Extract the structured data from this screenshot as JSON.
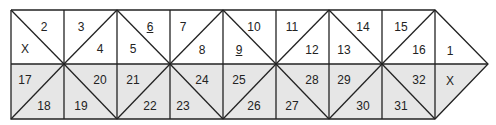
{
  "diagram": {
    "geometry": {
      "x_lines": [
        11,
        64,
        117,
        170,
        223,
        276,
        329,
        382,
        435
      ],
      "y_top": 10,
      "y_mid": 64,
      "y_bot": 119,
      "tip_x": 488
    },
    "colors": {
      "stroke": "#222222",
      "top_fill": "#ffffff",
      "bottom_fill": "#e6e6e6"
    },
    "labels": [
      {
        "text": "2",
        "x": 44,
        "y": 27
      },
      {
        "text": "X",
        "x": 25,
        "y": 49
      },
      {
        "text": "3",
        "x": 81,
        "y": 27
      },
      {
        "text": "4",
        "x": 100,
        "y": 49
      },
      {
        "text": "6",
        "x": 150,
        "y": 27,
        "underline": true
      },
      {
        "text": "5",
        "x": 133,
        "y": 49
      },
      {
        "text": "7",
        "x": 183,
        "y": 27
      },
      {
        "text": "8",
        "x": 202,
        "y": 50
      },
      {
        "text": "10",
        "x": 254,
        "y": 27
      },
      {
        "text": "9",
        "x": 239,
        "y": 50,
        "underline": true
      },
      {
        "text": "11",
        "x": 292,
        "y": 27
      },
      {
        "text": "12",
        "x": 312,
        "y": 50
      },
      {
        "text": "14",
        "x": 363,
        "y": 27
      },
      {
        "text": "13",
        "x": 344,
        "y": 50
      },
      {
        "text": "15",
        "x": 401,
        "y": 27
      },
      {
        "text": "16",
        "x": 419,
        "y": 50
      },
      {
        "text": "1",
        "x": 450,
        "y": 51
      },
      {
        "text": "17",
        "x": 25,
        "y": 80
      },
      {
        "text": "18",
        "x": 44,
        "y": 106
      },
      {
        "text": "20",
        "x": 100,
        "y": 80
      },
      {
        "text": "19",
        "x": 81,
        "y": 106
      },
      {
        "text": "21",
        "x": 133,
        "y": 80
      },
      {
        "text": "22",
        "x": 150,
        "y": 106
      },
      {
        "text": "24",
        "x": 202,
        "y": 80
      },
      {
        "text": "23",
        "x": 183,
        "y": 106
      },
      {
        "text": "25",
        "x": 239,
        "y": 80
      },
      {
        "text": "26",
        "x": 254,
        "y": 106
      },
      {
        "text": "28",
        "x": 312,
        "y": 80
      },
      {
        "text": "27",
        "x": 292,
        "y": 106
      },
      {
        "text": "29",
        "x": 344,
        "y": 80
      },
      {
        "text": "30",
        "x": 363,
        "y": 106
      },
      {
        "text": "32",
        "x": 419,
        "y": 80
      },
      {
        "text": "31",
        "x": 401,
        "y": 106
      },
      {
        "text": "X",
        "x": 450,
        "y": 81
      }
    ]
  }
}
